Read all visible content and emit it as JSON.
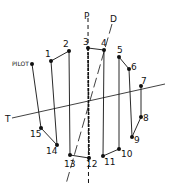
{
  "diagram": {
    "type": "flight-path-pattern",
    "colors": {
      "stroke": "#111111",
      "background": "#ffffff"
    },
    "axes": {
      "P": {
        "label": "P",
        "style": "dashed"
      },
      "D": {
        "label": "D",
        "style": "dashed"
      },
      "T": {
        "label": "T",
        "style": "solid"
      }
    },
    "points": [
      {
        "id": "PILOT",
        "label": "PILOT",
        "x": 32,
        "y": 64
      },
      {
        "id": "1",
        "label": "1",
        "x": 51,
        "y": 61
      },
      {
        "id": "2",
        "label": "2",
        "x": 69,
        "y": 51
      },
      {
        "id": "3",
        "label": "3",
        "x": 88,
        "y": 48
      },
      {
        "id": "4",
        "label": "4",
        "x": 104,
        "y": 50
      },
      {
        "id": "5",
        "label": "5",
        "x": 119,
        "y": 57
      },
      {
        "id": "6",
        "label": "6",
        "x": 129,
        "y": 69
      },
      {
        "id": "7",
        "label": "7",
        "x": 141,
        "y": 86
      },
      {
        "id": "8",
        "label": "8",
        "x": 141,
        "y": 117
      },
      {
        "id": "9",
        "label": "9",
        "x": 132,
        "y": 137
      },
      {
        "id": "10",
        "label": "10",
        "x": 119,
        "y": 149
      },
      {
        "id": "11",
        "label": "11",
        "x": 103,
        "y": 156
      },
      {
        "id": "12",
        "label": "12",
        "x": 89,
        "y": 158
      },
      {
        "id": "13",
        "label": "13",
        "x": 70,
        "y": 155
      },
      {
        "id": "14",
        "label": "14",
        "x": 57,
        "y": 145
      },
      {
        "id": "15",
        "label": "15",
        "x": 41,
        "y": 128
      }
    ],
    "edges": [
      [
        "PILOT",
        "15"
      ],
      [
        "15",
        "14"
      ],
      [
        "14",
        "1"
      ],
      [
        "1",
        "2"
      ],
      [
        "2",
        "13"
      ],
      [
        "13",
        "12"
      ],
      [
        "12",
        "3"
      ],
      [
        "3",
        "4"
      ],
      [
        "4",
        "11"
      ],
      [
        "11",
        "10"
      ],
      [
        "10",
        "5"
      ],
      [
        "5",
        "6"
      ],
      [
        "6",
        "9"
      ],
      [
        "9",
        "8"
      ],
      [
        "8",
        "7"
      ]
    ]
  }
}
